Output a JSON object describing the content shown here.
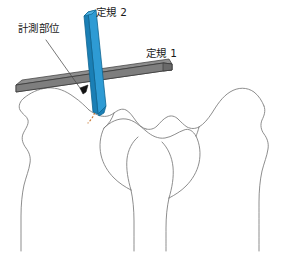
{
  "figure": {
    "background_color": "#ffffff",
    "width": 287,
    "height": 253
  },
  "labels": {
    "measurement_site": "計測部位",
    "ruler_2": "定規 2",
    "ruler_1": "定規 1"
  },
  "colors": {
    "ruler_blue_face": "#2E9BD4",
    "ruler_blue_shade": "#1A7FB5",
    "ruler_blue_edge": "#0F6590",
    "ruler_gray_face": "#7E7E7E",
    "ruler_gray_top": "#8C8C8C",
    "ruler_gray_edge": "#3A3A3A",
    "bone_outline": "#7A7A7A",
    "leader_line": "#4A4A4A",
    "arc_dotted": "#C8762F",
    "text": "#1A1A1A"
  },
  "elements": {
    "ruler_1_name": "gray-straightedge",
    "ruler_2_name": "blue-straightedge",
    "angle_arc_name": "dotted-angle-arc",
    "pointer_name": "measurement-site-arrow",
    "leader_name": "label-leader-line"
  }
}
